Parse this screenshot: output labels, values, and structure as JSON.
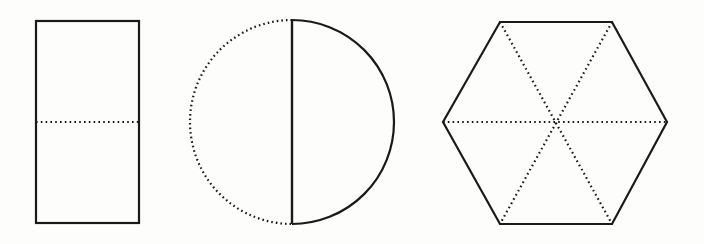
{
  "figure": {
    "title": "Geometric shapes divided into equal parts",
    "background_color": "#fdfdfb",
    "stroke_color": "#1a1a1a",
    "canvas": {
      "width": 704,
      "height": 244
    },
    "shape_count": 3,
    "shapes": [
      {
        "id": "rectangle",
        "name": "rectangle",
        "label": "Rectangle divided into 2 equal parts",
        "parts": 2,
        "partition_style": "dotted",
        "outline_style": "solid",
        "stroke_width": 2.2,
        "dot_pattern": "1.6 3.2",
        "geometry": {
          "x": 36,
          "y": 21,
          "width": 103,
          "height": 202,
          "center_x": 87.5,
          "center_y": 122
        },
        "partition_lines": [
          {
            "x1": 36,
            "y1": 122,
            "x2": 139,
            "y2": 122
          }
        ]
      },
      {
        "id": "circle",
        "name": "circle",
        "label": "Circle divided into 2 equal halves",
        "parts": 2,
        "partition_style": "solid-diameter",
        "outline_style": "half-solid-half-dotted",
        "stroke_width": 2.2,
        "dot_pattern": "1.6 3.0",
        "geometry": {
          "center_x": 292,
          "center_y": 122,
          "radius": 102,
          "top_y": 20,
          "bottom_y": 224,
          "left_x": 190,
          "right_x": 394
        },
        "arcs": [
          {
            "side": "left",
            "style": "dotted"
          },
          {
            "side": "right",
            "style": "solid"
          }
        ],
        "partition_lines": [
          {
            "x1": 292,
            "y1": 20,
            "x2": 292,
            "y2": 224
          }
        ]
      },
      {
        "id": "hexagon",
        "name": "hexagon",
        "label": "Hexagon divided into 6 equal triangles",
        "parts": 6,
        "partition_style": "dotted",
        "outline_style": "solid",
        "stroke_width": 2.2,
        "dot_pattern": "1.6 3.2",
        "geometry": {
          "center_x": 555,
          "center_y": 122,
          "left_vertex_x": 443,
          "right_vertex_x": 667,
          "top_edge_y": 22,
          "bottom_edge_y": 224,
          "top_edge_left_x": 500,
          "top_edge_right_x": 612
        },
        "vertices": [
          {
            "x": 500,
            "y": 22
          },
          {
            "x": 612,
            "y": 22
          },
          {
            "x": 667,
            "y": 122
          },
          {
            "x": 612,
            "y": 224
          },
          {
            "x": 500,
            "y": 224
          },
          {
            "x": 443,
            "y": 122
          }
        ],
        "partition_lines": [
          {
            "x1": 443,
            "y1": 122,
            "x2": 667,
            "y2": 122
          },
          {
            "x1": 500,
            "y1": 22,
            "x2": 612,
            "y2": 224
          },
          {
            "x1": 612,
            "y1": 22,
            "x2": 500,
            "y2": 224
          }
        ]
      }
    ]
  }
}
